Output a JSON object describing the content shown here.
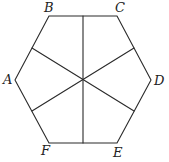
{
  "figure": {
    "type": "geometry-diagram",
    "stroke_color": "#2a2a2a",
    "label_color": "#222222",
    "background": "#ffffff"
  },
  "vertices": [
    {
      "label": "A",
      "x": 15,
      "y": 80,
      "label_x": 3,
      "label_y": 84
    },
    {
      "label": "B",
      "x": 49,
      "y": 16,
      "label_x": 44,
      "label_y": 12
    },
    {
      "label": "C",
      "x": 117,
      "y": 16,
      "label_x": 115,
      "label_y": 12
    },
    {
      "label": "D",
      "x": 151,
      "y": 80,
      "label_x": 154,
      "label_y": 85
    },
    {
      "label": "E",
      "x": 117,
      "y": 143,
      "label_x": 113,
      "label_y": 157
    },
    {
      "label": "F",
      "x": 49,
      "y": 143,
      "label_x": 41,
      "label_y": 155
    }
  ],
  "center": {
    "x": 83,
    "y": 80
  },
  "segments": [
    {
      "name": "BC-to-EF-midpoints",
      "from": {
        "x": 83,
        "y": 16
      },
      "to": {
        "x": 83,
        "y": 143
      }
    },
    {
      "name": "AB-to-DE-midpoints",
      "from": {
        "x": 32,
        "y": 48
      },
      "to": {
        "x": 134,
        "y": 111
      }
    },
    {
      "name": "CD-to-FA-midpoints",
      "from": {
        "x": 134,
        "y": 48
      },
      "to": {
        "x": 32,
        "y": 111
      }
    }
  ],
  "labels": {
    "A": "A",
    "B": "B",
    "C": "C",
    "D": "D",
    "E": "E",
    "F": "F"
  }
}
